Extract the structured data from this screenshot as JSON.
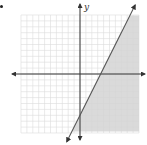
{
  "figure": {
    "bullet": "•",
    "y_axis_label": "y",
    "x_axis_label": "",
    "grid": {
      "x_min": -10,
      "x_max": 10,
      "y_min": -10,
      "y_max": 10,
      "step": 1,
      "origin_px": [
        80,
        74
      ],
      "unit_px": 5.9
    },
    "boundary_line": {
      "equation": "y = 2x - 7",
      "slope": 2,
      "intercept": -7,
      "style": "solid",
      "color": "#555555"
    },
    "shaded_region": {
      "inequality": "y ≤ 2x − 7",
      "side": "below-right",
      "color": "#d3d3d3"
    },
    "colors": {
      "grid": "#d9d9d9",
      "axis": "#333333",
      "background": "#ffffff"
    }
  }
}
